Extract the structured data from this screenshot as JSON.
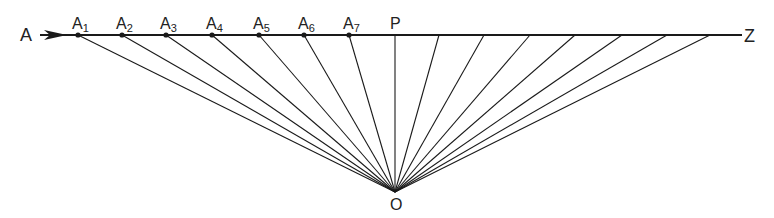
{
  "diagram": {
    "baseline": {
      "start_label": "A",
      "end_label": "Z",
      "x1": 40,
      "x2": 742,
      "y": 35
    },
    "apex": {
      "label": "O",
      "x": 395,
      "y": 192
    },
    "points_left": [
      {
        "label": "A",
        "sub": "1",
        "x": 78
      },
      {
        "label": "A",
        "sub": "2",
        "x": 122
      },
      {
        "label": "A",
        "sub": "3",
        "x": 166
      },
      {
        "label": "A",
        "sub": "4",
        "x": 212
      },
      {
        "label": "A",
        "sub": "5",
        "x": 259
      },
      {
        "label": "A",
        "sub": "6",
        "x": 304
      },
      {
        "label": "A",
        "sub": "7",
        "x": 349
      }
    ],
    "perpendicular": {
      "label": "P",
      "x": 395
    },
    "points_right_x": [
      439,
      484,
      530,
      575,
      622,
      667,
      710
    ],
    "colors": {
      "line": "#1a1a1a",
      "background": "#ffffff"
    }
  }
}
